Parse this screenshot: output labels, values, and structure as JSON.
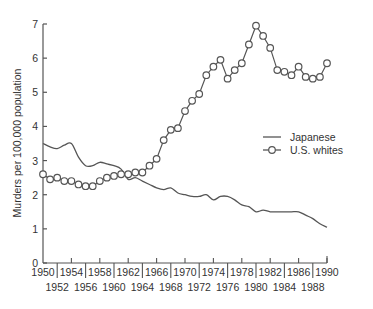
{
  "chart_data": {
    "type": "line",
    "title": "",
    "xlabel": "",
    "ylabel": "Murders per 100,000 population",
    "xlim": [
      1950,
      1990
    ],
    "ylim": [
      0,
      7
    ],
    "yticks": [
      0,
      1,
      2,
      3,
      4,
      5,
      6,
      7
    ],
    "xticks_upper": [
      "1950",
      "1954",
      "1958",
      "1962",
      "1966",
      "1970",
      "1974",
      "1978",
      "1982",
      "1986",
      "1990"
    ],
    "xticks_lower": [
      "1952",
      "1956",
      "1960",
      "1964",
      "1968",
      "1972",
      "1976",
      "1980",
      "1984",
      "1988"
    ],
    "grid": false,
    "legend_position": "right-middle",
    "series": [
      {
        "name": "Japanese",
        "marker": "none",
        "x": [
          1950,
          1951,
          1952,
          1953,
          1954,
          1955,
          1956,
          1957,
          1958,
          1959,
          1960,
          1961,
          1962,
          1963,
          1964,
          1965,
          1966,
          1967,
          1968,
          1969,
          1970,
          1971,
          1972,
          1973,
          1974,
          1975,
          1976,
          1977,
          1978,
          1979,
          1980,
          1981,
          1982,
          1983,
          1984,
          1985,
          1986,
          1987,
          1988,
          1989,
          1990
        ],
        "values": [
          3.5,
          3.4,
          3.35,
          3.45,
          3.5,
          3.1,
          2.85,
          2.85,
          2.95,
          2.9,
          2.85,
          2.75,
          2.45,
          2.5,
          2.4,
          2.3,
          2.2,
          2.15,
          2.2,
          2.05,
          2.0,
          1.95,
          1.95,
          2.0,
          1.85,
          1.95,
          1.95,
          1.85,
          1.7,
          1.65,
          1.5,
          1.55,
          1.5,
          1.5,
          1.5,
          1.5,
          1.5,
          1.4,
          1.3,
          1.15,
          1.05
        ]
      },
      {
        "name": "U.S. whites",
        "marker": "circle",
        "x": [
          1950,
          1951,
          1952,
          1953,
          1954,
          1955,
          1956,
          1957,
          1958,
          1959,
          1960,
          1961,
          1962,
          1963,
          1964,
          1965,
          1966,
          1967,
          1968,
          1969,
          1970,
          1971,
          1972,
          1973,
          1974,
          1975,
          1976,
          1977,
          1978,
          1979,
          1980,
          1981,
          1982,
          1983,
          1984,
          1985,
          1986,
          1987,
          1988,
          1989,
          1990
        ],
        "values": [
          2.6,
          2.45,
          2.5,
          2.4,
          2.4,
          2.3,
          2.25,
          2.25,
          2.4,
          2.5,
          2.55,
          2.6,
          2.6,
          2.65,
          2.65,
          2.85,
          3.05,
          3.6,
          3.9,
          3.95,
          4.45,
          4.75,
          4.95,
          5.5,
          5.75,
          5.95,
          5.4,
          5.65,
          5.85,
          6.4,
          6.95,
          6.65,
          6.3,
          5.65,
          5.6,
          5.5,
          5.75,
          5.45,
          5.4,
          5.45,
          5.85
        ]
      }
    ]
  },
  "legend": {
    "items": [
      {
        "label": "Japanese",
        "marker": "line"
      },
      {
        "label": "U.S. whites",
        "marker": "line-circle"
      }
    ]
  },
  "axes": {
    "ylabel": "Murders per 100,000 population"
  }
}
